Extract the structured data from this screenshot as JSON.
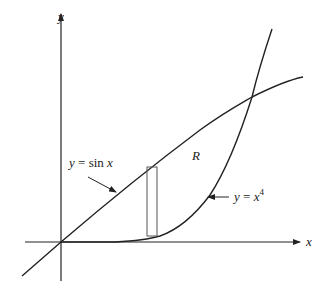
{
  "diagram": {
    "type": "area-between-curves",
    "axes": {
      "x_label": "x",
      "y_label": "y"
    },
    "curves": [
      {
        "id": "sine",
        "label_prefix": "y = ",
        "label_func": "sin",
        "label_var": "x",
        "expression": "y = sin x"
      },
      {
        "id": "quartic",
        "label_prefix": "y = ",
        "label_var": "x",
        "label_exp": "4",
        "expression": "y = x^4"
      }
    ],
    "region_label": "R",
    "elements": [
      "x-axis with arrow",
      "y-axis with arrow",
      "curve y = sin x",
      "curve y = x^4",
      "shaded region R between curves",
      "vertical representative rectangle",
      "label arrows pointing to curves"
    ],
    "colors": {
      "stroke": "#222222",
      "background": "#ffffff",
      "rectangle": "#555555"
    }
  }
}
